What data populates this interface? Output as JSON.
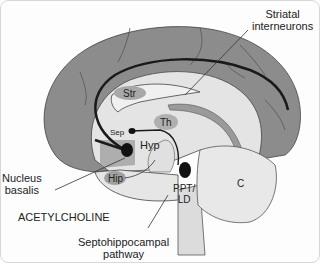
{
  "diagram": {
    "title": "ACETYLCHOLINE",
    "labels": {
      "striatal_line1": "Striatal",
      "striatal_line2": "interneurons",
      "nucleus_line1": "Nucleus",
      "nucleus_line2": "basalis",
      "septo_line1": "Septohippocampal",
      "septo_line2": "pathway",
      "str": "Str",
      "th": "Th",
      "sep": "Sep",
      "hyp": "Hyp",
      "hip": "Hip",
      "ppt_line1": "PPT/",
      "ppt_line2": "LD",
      "c": "C"
    },
    "colors": {
      "cortex": "#8c8c8c",
      "inner": "#e4e4e4",
      "structure": "#a8a8a8",
      "cerebellum": "#e8e8e8",
      "pathway": "#1a1a1a"
    }
  }
}
